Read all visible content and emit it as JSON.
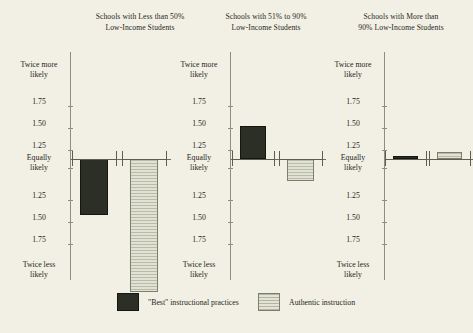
{
  "figure": {
    "background_color": "#f2f0e4",
    "axis_color": "#8d8d80"
  },
  "legend": {
    "items": [
      {
        "label": "\"Best\" instructional practices",
        "swatch": "best-swatch",
        "color": "#2b2f25"
      },
      {
        "label": "Authentic instruction",
        "swatch": "authentic-swatch",
        "color": "#c8c8b8"
      }
    ]
  },
  "axis": {
    "labels": [
      {
        "line1": "Twice more",
        "line2": "likely",
        "value": 2.0
      },
      {
        "line1": "1.75",
        "line2": "",
        "value": 1.75
      },
      {
        "line1": "1.50",
        "line2": "",
        "value": 1.5
      },
      {
        "line1": "1.25",
        "line2": "",
        "value": 1.25
      },
      {
        "line1": "Equally",
        "line2": "likely",
        "value": 1.0
      },
      {
        "line1": "1.25",
        "line2": "",
        "value": -1.25
      },
      {
        "line1": "1.50",
        "line2": "",
        "value": -1.5
      },
      {
        "line1": "1.75",
        "line2": "",
        "value": -1.75
      },
      {
        "line1": "Twice less",
        "line2": "likely",
        "value": -2.0
      }
    ]
  },
  "panels": [
    {
      "id": "panel-less-than-50",
      "title_line1": "Schools with Less than 50%",
      "title_line2": "Low-Income Students",
      "bars": [
        {
          "series": "\"Best\" instructional practices",
          "direction": "down",
          "value": -1.3,
          "ci_low": -1.55,
          "ci_high": 1.05
        },
        {
          "series": "Authentic instruction",
          "direction": "down",
          "value": -1.72,
          "ci_low": -1.85,
          "ci_high": 1.02
        }
      ]
    },
    {
      "id": "panel-51-to-90",
      "title_line1": "Schools with 51% to 90%",
      "title_line2": "Low-Income Students",
      "bars": [
        {
          "series": "\"Best\" instructional practices",
          "direction": "up",
          "value": 1.18,
          "ci_low": -1.05,
          "ci_high": 1.3
        },
        {
          "series": "Authentic instruction",
          "direction": "down",
          "value": -1.12,
          "ci_low": -1.22,
          "ci_high": 1.08
        }
      ]
    },
    {
      "id": "panel-more-than-90",
      "title_line1": "Schools with More than",
      "title_line2": "90% Low-Income Students",
      "bars": [
        {
          "series": "\"Best\" instructional practices",
          "direction": "flat",
          "value": 1.01,
          "ci_low": -1.03,
          "ci_high": 1.04
        },
        {
          "series": "Authentic instruction",
          "direction": "up",
          "value": 1.04,
          "ci_low": -1.04,
          "ci_high": 1.12
        }
      ]
    }
  ],
  "chart_data": {
    "type": "bar",
    "title": "",
    "subtitle": "",
    "xlabel": "",
    "ylabel": "Odds of occurrence relative to equal likelihood",
    "grid": false,
    "legend_position": "bottom",
    "ytick_labels": [
      "Twice more likely",
      "1.75",
      "1.50",
      "1.25",
      "Equally likely",
      "1.25",
      "1.50",
      "1.75",
      "Twice less likely"
    ],
    "ylim": [
      -2.0,
      2.0
    ],
    "baseline_label": "Equally likely",
    "categories": [
      "Schools with Less than 50% Low-Income Students",
      "Schools with 51% to 90% Low-Income Students",
      "Schools with More than 90% Low-Income Students"
    ],
    "series": [
      {
        "name": "\"Best\" instructional practices",
        "color": "#2b2f25",
        "values": [
          -1.3,
          1.18,
          1.01
        ],
        "errors_low": [
          -1.55,
          -1.05,
          -1.03
        ],
        "errors_high": [
          1.05,
          1.3,
          1.04
        ]
      },
      {
        "name": "Authentic instruction",
        "color": "#c8c8b8",
        "values": [
          -1.72,
          -1.12,
          1.04
        ],
        "errors_low": [
          -1.85,
          -1.22,
          -1.04
        ],
        "errors_high": [
          1.02,
          1.08,
          1.12
        ]
      }
    ]
  }
}
